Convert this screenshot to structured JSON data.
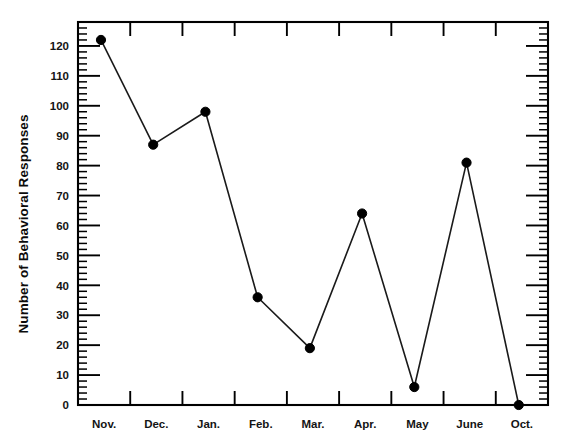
{
  "chart_data": {
    "type": "line",
    "title": "",
    "subtitle": "",
    "xlabel": "",
    "ylabel": "Number of Behavioral Responses",
    "categories": [
      "Nov.",
      "Dec.",
      "Jan.",
      "Feb.",
      "Mar.",
      "Apr.",
      "May",
      "June",
      "Oct."
    ],
    "values": [
      122,
      87,
      98,
      36,
      19,
      64,
      6,
      81,
      0
    ],
    "series": [
      {
        "name": "Number of Behavioral Responses",
        "values": [
          122,
          87,
          98,
          36,
          19,
          64,
          6,
          81,
          0
        ]
      }
    ],
    "ylim": [
      0,
      128
    ],
    "y_major_ticks": [
      0,
      10,
      20,
      30,
      40,
      50,
      60,
      70,
      80,
      90,
      100,
      110,
      120
    ],
    "y_major_tick_labels": [
      "0",
      "10",
      "20",
      "30",
      "40",
      "50",
      "60",
      "70",
      "80",
      "90",
      "100",
      "110",
      "120"
    ],
    "y_minor_tick_interval": 2,
    "grid": false,
    "legend": false,
    "legend_position": "none",
    "marker": "filled-circle",
    "marker_color": "#000000",
    "line_color": "#1a1a1a",
    "axis_color": "#000000",
    "background_color": "#ffffff",
    "frame": "box",
    "ticks_all_sides": true,
    "annotations": []
  },
  "figure": {
    "alt": "Line chart of number of behavioral responses by month"
  }
}
